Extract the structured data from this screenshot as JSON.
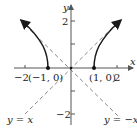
{
  "diagram": {
    "title": "",
    "axes": {
      "x_label": "x",
      "y_label": "y",
      "x_ticks": [
        {
          "value": -2,
          "label": "−2"
        },
        {
          "value": 1,
          "label": ""
        },
        {
          "value": 2,
          "label": "2"
        }
      ],
      "y_ticks": [
        {
          "value": 2,
          "label": "2"
        },
        {
          "value": 1,
          "label": ""
        },
        {
          "value": -1,
          "label": ""
        },
        {
          "value": -2,
          "label": "−2"
        }
      ]
    },
    "points": [
      {
        "label": "(−1, 0)",
        "x": -1,
        "y": 0
      },
      {
        "label": "(1, 0)",
        "x": 1,
        "y": 0
      }
    ],
    "asymptotes": [
      {
        "label": "y = x",
        "slope": 1,
        "style": "dashed"
      },
      {
        "label": "y = −x",
        "slope": -1,
        "style": "dashed"
      }
    ],
    "curve": {
      "description": "upper branches of hyperbola y = sqrt(x^2 - 1)",
      "branches": [
        "x ≤ −1",
        "x ≥ 1"
      ],
      "color": "#1a1a1a"
    },
    "colors": {
      "axis": "#555555",
      "curve": "#1a1a1a",
      "asymptote": "#888888"
    }
  }
}
